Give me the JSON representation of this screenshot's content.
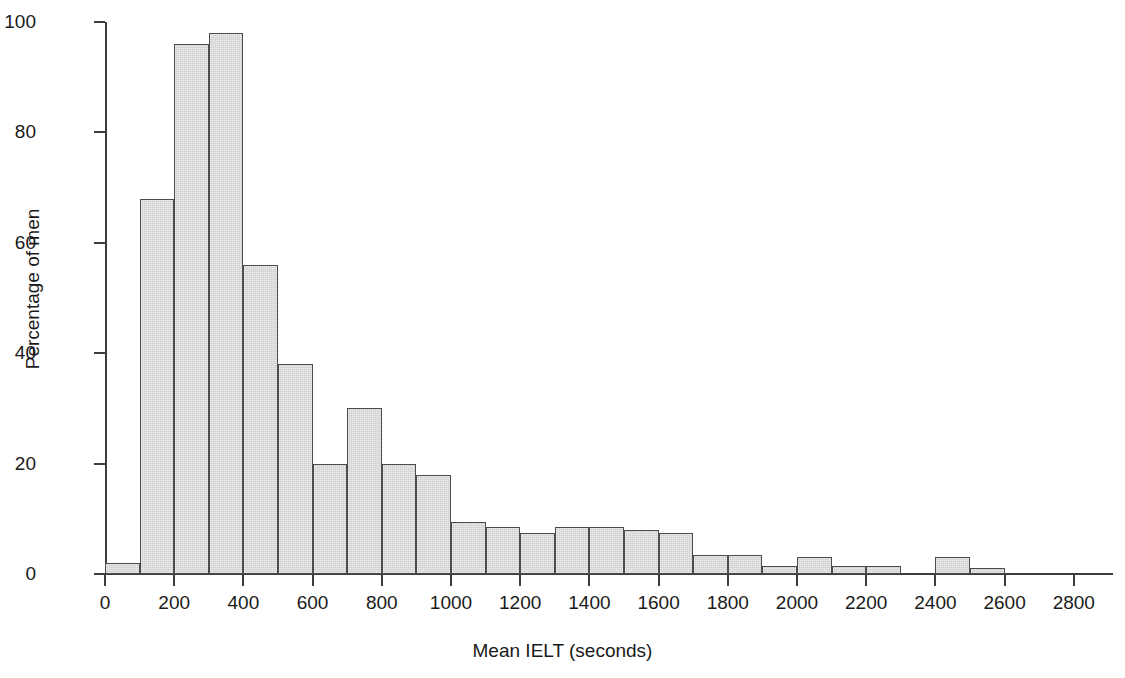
{
  "chart_data": {
    "type": "bar",
    "title": "",
    "subtitle": "",
    "xlabel": "Mean IELT (seconds)",
    "ylabel": "Percentage of men",
    "xlim": [
      0,
      2900
    ],
    "ylim": [
      0,
      100
    ],
    "grid": false,
    "legend": null,
    "bin_width": 100,
    "x_tick_labels": [
      "0",
      "200",
      "400",
      "600",
      "800",
      "1000",
      "1200",
      "1400",
      "1600",
      "1800",
      "2000",
      "2200",
      "2400",
      "2600",
      "2800"
    ],
    "x_tick_values": [
      0,
      200,
      400,
      600,
      800,
      1000,
      1200,
      1400,
      1600,
      1800,
      2000,
      2200,
      2400,
      2600,
      2800
    ],
    "y_tick_labels": [
      "0",
      "20",
      "40",
      "60",
      "80",
      "100"
    ],
    "y_tick_values": [
      0,
      20,
      40,
      60,
      80,
      100
    ],
    "categories": [
      "0-100",
      "100-200",
      "200-300",
      "300-400",
      "400-500",
      "500-600",
      "600-700",
      "700-800",
      "800-900",
      "900-1000",
      "1000-1100",
      "1100-1200",
      "1200-1300",
      "1300-1400",
      "1400-1500",
      "1500-1600",
      "1600-1700",
      "1700-1800",
      "1800-1900",
      "1900-2000",
      "2000-2100",
      "2100-2200",
      "2200-2300",
      "2300-2400",
      "2400-2500",
      "2500-2600",
      "2600-2700",
      "2700-2800",
      "2800-2900"
    ],
    "bin_starts": [
      0,
      100,
      200,
      300,
      400,
      500,
      600,
      700,
      800,
      900,
      1000,
      1100,
      1200,
      1300,
      1400,
      1500,
      1600,
      1700,
      1800,
      1900,
      2000,
      2100,
      2200,
      2300,
      2400,
      2500,
      2600,
      2700,
      2800
    ],
    "values": [
      2,
      68,
      96,
      98,
      56,
      38,
      20,
      30,
      20,
      18,
      9.5,
      8.5,
      7.5,
      8.5,
      8.5,
      8,
      7.5,
      3.5,
      3.5,
      1.5,
      3,
      1.5,
      1.5,
      0,
      3,
      1,
      0,
      0,
      0
    ]
  },
  "style": {
    "bar_fill": "#cdcdcd",
    "bar_border": "#4c4c4c",
    "axis_color": "#3d3d3d",
    "text_color": "#1a1a1a",
    "background": "#ffffff"
  }
}
